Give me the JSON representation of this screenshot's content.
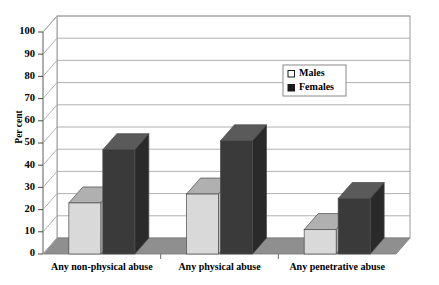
{
  "chart_data": {
    "type": "bar",
    "title": "",
    "subtitle": "",
    "xlabel": "",
    "ylabel": "Per cent",
    "ylim": [
      0,
      100
    ],
    "ytick_step": 10,
    "yticks": [
      "0",
      "10",
      "20",
      "30",
      "40",
      "50",
      "60",
      "70",
      "80",
      "90",
      "100"
    ],
    "grid": true,
    "grid_axis": "y",
    "three_d": true,
    "legend_position": "upper-right-inside",
    "categories": [
      "Any non-physical abuse",
      "Any physical abuse",
      "Any penetrative abuse"
    ],
    "series": [
      {
        "name": "Males",
        "marker": "open-square",
        "color": "#d9d9d9",
        "top_color": "#b0b0b0",
        "side_color": "#c2c2c2",
        "values": [
          23,
          27,
          11
        ]
      },
      {
        "name": "Females",
        "marker": "filled-square",
        "color": "#3a3a3a",
        "top_color": "#5a5a5a",
        "side_color": "#2a2a2a",
        "values": [
          47,
          51,
          25
        ]
      }
    ]
  },
  "legend": {
    "entries": [
      {
        "label": "Males",
        "swatch": "open-square-icon"
      },
      {
        "label": "Females",
        "swatch": "filled-square-icon"
      }
    ]
  },
  "axis": {
    "y_title": "Per cent"
  },
  "colors": {
    "plot_background": "#ffffff",
    "page_background": "#ffffff",
    "frame_line": "#9a9a9a",
    "grid_line": "#a8a8a8",
    "floor": "#8f8f8f",
    "floor_front": "#6f6f6f",
    "legend_border": "#8a8a8a"
  }
}
